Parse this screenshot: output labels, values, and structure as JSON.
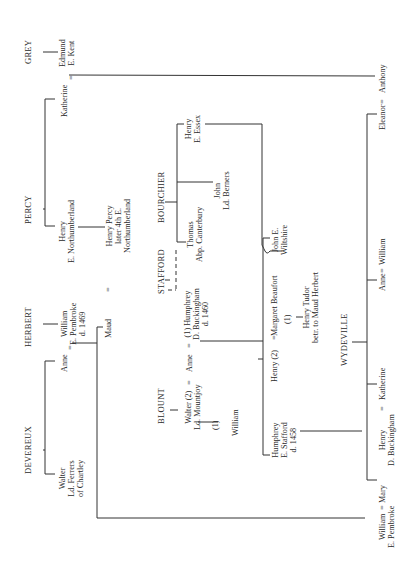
{
  "families": {
    "grey": "GREY",
    "percy": "PERCY",
    "herbert": "HERBERT",
    "devereux": "DEVEREUX",
    "bourchier": "BOURCHIER",
    "stafford": "STAFFORD",
    "blount": "BLOUNT",
    "wydeville": "WYDEVILLE"
  },
  "people": {
    "edmund": [
      "Edmund",
      "E. Kent"
    ],
    "katherine_grey": "Katherine",
    "henry_percy": [
      "Henry",
      "E. Northumberland"
    ],
    "henry_percy_son": [
      "Henry Percy",
      "later 4th E.",
      "Northumberland"
    ],
    "anne_devereux": "Anne",
    "william_herbert": [
      "William",
      "E. Pembroke",
      "d. 1469"
    ],
    "maud": "Maud",
    "walter_devereux": [
      "Walter",
      "Ld. Ferrers",
      "of Chartley"
    ],
    "henry_essex": [
      "Henry",
      "E. Essex"
    ],
    "john_berners": [
      "John",
      "Ld. Berners"
    ],
    "thomas_bourchier": [
      "Thomas",
      "Abp. Canterbury"
    ],
    "humphrey_buckingham": [
      "(1) Humphrey",
      "D. Buckingham",
      "d. 1460"
    ],
    "anne_stafford": "Anne",
    "walter_blount": [
      "Walter (2)",
      "Ld. Mountjoy"
    ],
    "blount_marker": "(1)",
    "william_blount": "William",
    "henry_stafford": "Henry (2)",
    "margaret_beaufort": "Margaret Beaufort",
    "beaufort_marker": "(1)",
    "henry_tudor": [
      "Henry Tudor",
      "betr. to Maud Herbert"
    ],
    "john_wiltshire": [
      "John E.",
      "Wiltshire"
    ],
    "humphrey_stafford": [
      "Humphrey",
      "E. Stafford",
      "d. 1458"
    ],
    "henry_buckingham": [
      "Henry",
      "D. Buckingham"
    ],
    "katherine_wydeville": "Katherine",
    "anne_wydeville": "Anne",
    "william_bourchier": "William",
    "eleanor": "Eleanor",
    "anthony": "Anthony",
    "william_pembroke": [
      "William",
      "E. Pembroke"
    ],
    "mary": "Mary"
  },
  "symbols": {
    "eq": "="
  }
}
